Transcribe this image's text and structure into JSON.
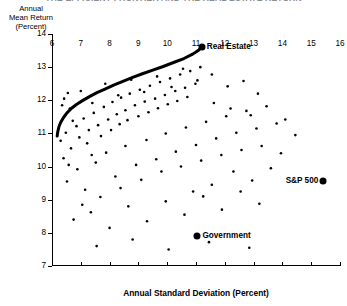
{
  "title_cut": "THE EFFICIENT FRONTIER AND THE REAL ESTATE RETURN",
  "axis": {
    "y_caption_lines": [
      "Annual",
      "Mean Return",
      "(Percent)"
    ],
    "y_ticks": [
      7,
      8,
      9,
      10,
      11,
      12,
      13,
      14
    ],
    "x_ticks": [
      6,
      7,
      8,
      9,
      10,
      11,
      12,
      13,
      14,
      15,
      16
    ],
    "x_title": "Annual Standard Deviation (Percent)"
  },
  "chart_data": {
    "type": "scatter",
    "title": "THE EFFICIENT FRONTIER AND THE REAL ESTATE RETURN",
    "xlabel": "Annual Standard Deviation (Percent)",
    "ylabel": "Annual Mean Return (Percent)",
    "xlim": [
      6,
      16
    ],
    "ylim": [
      7,
      14
    ],
    "xticks": [
      6,
      7,
      8,
      9,
      10,
      11,
      12,
      13,
      14,
      15,
      16
    ],
    "yticks": [
      7,
      8,
      9,
      10,
      11,
      12,
      13,
      14
    ],
    "grid": false,
    "legend": "none",
    "series": [
      {
        "name": "Efficient Frontier",
        "type": "line",
        "color": "#000000",
        "linewidth": 3,
        "points": [
          [
            6.18,
            10.92
          ],
          [
            6.2,
            11.05
          ],
          [
            6.24,
            11.2
          ],
          [
            6.3,
            11.33
          ],
          [
            6.4,
            11.48
          ],
          [
            6.52,
            11.62
          ],
          [
            6.68,
            11.76
          ],
          [
            6.86,
            11.88
          ],
          [
            7.06,
            11.99
          ],
          [
            7.3,
            12.11
          ],
          [
            7.56,
            12.23
          ],
          [
            7.84,
            12.34
          ],
          [
            8.14,
            12.46
          ],
          [
            8.46,
            12.57
          ],
          [
            8.8,
            12.69
          ],
          [
            9.14,
            12.8
          ],
          [
            9.5,
            12.91
          ],
          [
            9.86,
            13.02
          ],
          [
            10.22,
            13.14
          ],
          [
            10.58,
            13.26
          ],
          [
            10.9,
            13.4
          ],
          [
            11.1,
            13.52
          ],
          [
            11.2,
            13.6
          ]
        ]
      },
      {
        "name": "Individual Assets / Portfolios",
        "type": "scatter",
        "color": "#000000",
        "marker_size": 1.3,
        "points": [
          [
            6.3,
            10.78
          ],
          [
            6.48,
            11.02
          ],
          [
            6.66,
            10.55
          ],
          [
            6.85,
            11.22
          ],
          [
            6.4,
            10.25
          ],
          [
            6.95,
            10.88
          ],
          [
            7.1,
            11.45
          ],
          [
            7.28,
            11.1
          ],
          [
            6.58,
            10.05
          ],
          [
            7.45,
            11.62
          ],
          [
            7.6,
            11.25
          ],
          [
            7.22,
            10.7
          ],
          [
            6.72,
            11.38
          ],
          [
            7.8,
            11.8
          ],
          [
            7.95,
            11.42
          ],
          [
            7.38,
            10.35
          ],
          [
            8.1,
            11.95
          ],
          [
            8.25,
            11.58
          ],
          [
            7.7,
            10.92
          ],
          [
            8.4,
            12.08
          ],
          [
            8.55,
            11.7
          ],
          [
            8.05,
            11.1
          ],
          [
            8.7,
            12.2
          ],
          [
            8.88,
            11.85
          ],
          [
            8.35,
            11.28
          ],
          [
            9.05,
            12.32
          ],
          [
            9.22,
            11.96
          ],
          [
            8.62,
            11.4
          ],
          [
            9.4,
            12.44
          ],
          [
            9.58,
            12.05
          ],
          [
            9.0,
            11.52
          ],
          [
            9.75,
            12.55
          ],
          [
            9.92,
            12.16
          ],
          [
            9.35,
            11.64
          ],
          [
            10.1,
            12.66
          ],
          [
            10.28,
            12.28
          ],
          [
            9.68,
            11.76
          ],
          [
            10.45,
            12.78
          ],
          [
            10.62,
            12.38
          ],
          [
            10.02,
            11.88
          ],
          [
            10.8,
            12.88
          ],
          [
            10.98,
            12.5
          ],
          [
            10.35,
            11.98
          ],
          [
            11.15,
            13.0
          ],
          [
            10.7,
            12.1
          ],
          [
            6.52,
            9.55
          ],
          [
            6.88,
            9.92
          ],
          [
            7.15,
            9.3
          ],
          [
            7.52,
            10.12
          ],
          [
            7.05,
            8.85
          ],
          [
            7.88,
            10.42
          ],
          [
            8.2,
            9.7
          ],
          [
            7.68,
            9.08
          ],
          [
            8.55,
            10.62
          ],
          [
            8.92,
            10.05
          ],
          [
            8.38,
            9.35
          ],
          [
            9.28,
            10.8
          ],
          [
            9.62,
            10.22
          ],
          [
            9.1,
            9.6
          ],
          [
            9.95,
            11.0
          ],
          [
            10.3,
            10.45
          ],
          [
            9.8,
            9.85
          ],
          [
            10.65,
            11.18
          ],
          [
            11.0,
            10.65
          ],
          [
            10.48,
            10.0
          ],
          [
            11.35,
            11.35
          ],
          [
            11.7,
            10.85
          ],
          [
            11.18,
            10.18
          ],
          [
            12.05,
            11.52
          ],
          [
            12.4,
            11.02
          ],
          [
            11.88,
            10.35
          ],
          [
            12.75,
            11.68
          ],
          [
            13.1,
            11.15
          ],
          [
            12.58,
            10.5
          ],
          [
            13.45,
            11.82
          ],
          [
            13.8,
            11.3
          ],
          [
            13.28,
            10.62
          ],
          [
            6.75,
            8.4
          ],
          [
            7.35,
            8.62
          ],
          [
            8.0,
            8.15
          ],
          [
            8.65,
            8.8
          ],
          [
            9.3,
            8.35
          ],
          [
            9.95,
            8.95
          ],
          [
            10.6,
            8.55
          ],
          [
            11.25,
            9.1
          ],
          [
            11.9,
            8.7
          ],
          [
            12.55,
            9.25
          ],
          [
            13.2,
            8.88
          ],
          [
            7.55,
            7.6
          ],
          [
            8.8,
            7.8
          ],
          [
            10.05,
            7.5
          ],
          [
            11.45,
            7.72
          ],
          [
            12.85,
            7.55
          ],
          [
            6.42,
            12.05
          ],
          [
            6.62,
            11.75
          ],
          [
            7.0,
            12.28
          ],
          [
            7.4,
            11.92
          ],
          [
            7.85,
            12.5
          ],
          [
            8.3,
            12.15
          ],
          [
            8.75,
            12.62
          ],
          [
            9.2,
            12.25
          ],
          [
            9.65,
            12.72
          ],
          [
            10.15,
            12.4
          ],
          [
            10.55,
            12.95
          ],
          [
            11.05,
            12.6
          ],
          [
            11.55,
            12.78
          ],
          [
            12.1,
            12.42
          ],
          [
            12.65,
            12.58
          ],
          [
            13.15,
            12.2
          ],
          [
            11.62,
            11.92
          ],
          [
            12.2,
            11.75
          ],
          [
            12.9,
            11.55
          ],
          [
            6.35,
            11.85
          ],
          [
            6.55,
            12.22
          ],
          [
            14.1,
            11.42
          ],
          [
            14.45,
            10.95
          ],
          [
            13.95,
            10.4
          ],
          [
            12.3,
            9.85
          ],
          [
            11.55,
            9.45
          ],
          [
            10.9,
            9.25
          ],
          [
            13.6,
            9.95
          ],
          [
            12.95,
            9.58
          ]
        ]
      }
    ],
    "annotations": [
      {
        "label": "Real Estate",
        "x": 11.2,
        "y": 13.6,
        "side": "right"
      },
      {
        "label": "S&P 500",
        "x": 15.42,
        "y": 9.56,
        "side": "left"
      },
      {
        "label": "Government",
        "x": 11.05,
        "y": 7.92,
        "side": "right"
      }
    ]
  }
}
